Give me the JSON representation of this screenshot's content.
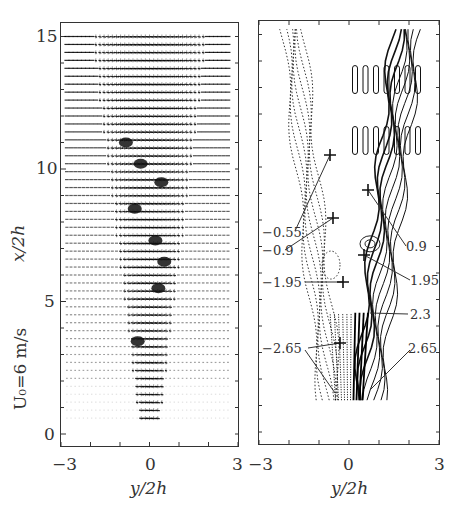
{
  "figure": {
    "left_panel": {
      "name": "velocity-vector-field",
      "y_ticks": [
        "15",
        "10",
        "5",
        "0"
      ],
      "x_ticks": [
        "−3",
        "0",
        "3"
      ],
      "xlabel": "y/2h",
      "ylabel": "x/2h",
      "side_label": "U₀=6 m/s"
    },
    "right_panel": {
      "name": "vorticity-contour-map",
      "x_ticks": [
        "−3",
        "0",
        "3"
      ],
      "xlabel": "y/2h",
      "contour_labels": [
        {
          "id": "neg055",
          "text": "−0.55"
        },
        {
          "id": "neg09",
          "text": "−0.9"
        },
        {
          "id": "pos09",
          "text": "0.9"
        },
        {
          "id": "neg195",
          "text": "−1.95"
        },
        {
          "id": "pos195",
          "text": "1.95"
        },
        {
          "id": "pos23",
          "text": "2.3"
        },
        {
          "id": "neg265",
          "text": "−2.65"
        },
        {
          "id": "pos265",
          "text": "2.65"
        }
      ]
    }
  },
  "chart_data": [
    {
      "type": "vector_field",
      "title": "",
      "xlabel": "y/2h",
      "ylabel": "x/2h",
      "xlim": [
        -3,
        3
      ],
      "ylim": [
        0,
        15.5
      ],
      "x_ticks": [
        -3,
        0,
        3
      ],
      "y_ticks": [
        0,
        5,
        10,
        15
      ],
      "annotation": "U₀=6 m/s",
      "description": "PIV velocity vectors of a plane jet issuing at y/2h=0 from x/2h≈0.7, spreading downstream; vortex cores marked near (−0.4,3.5), (0.3,5.5), (0.5,6.5), (−0.5,8.5), (0.4,9.5), (−0.8,11)",
      "grid": false
    },
    {
      "type": "contour",
      "title": "",
      "xlabel": "y/2h",
      "ylabel": "",
      "xlim": [
        -3,
        3
      ],
      "ylim": [
        0,
        15.5
      ],
      "x_ticks": [
        -3,
        0,
        3
      ],
      "levels_labeled": [
        -2.65,
        -1.95,
        -0.9,
        -0.55,
        0.9,
        1.95,
        2.3,
        2.65
      ],
      "negative_style": "dotted",
      "positive_style": "solid",
      "grid": false
    }
  ]
}
